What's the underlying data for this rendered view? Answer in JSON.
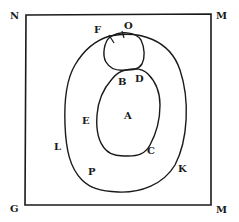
{
  "diagram": {
    "type": "set-region-diagram",
    "colors": {
      "stroke": "#1a1a1a",
      "background": "#ffffff"
    },
    "corner_labels": {
      "top_left": "N",
      "top_right": "M",
      "bottom_left": "G",
      "bottom_right": "M"
    },
    "region_labels": {
      "small_circle_top_left": "F",
      "small_circle_top": "O",
      "junction_left": "B",
      "junction_right": "D",
      "inner_oval_left": "E",
      "inner_oval_center": "A",
      "inner_oval_lower_right": "C",
      "outer_oval_left": "L",
      "outer_oval_lower_left": "P",
      "outer_oval_lower_right": "K"
    },
    "shapes": [
      {
        "name": "rectangle-frame",
        "corners": [
          "N",
          "M",
          "M",
          "G"
        ]
      },
      {
        "name": "outer-oval",
        "labels": [
          "L",
          "P",
          "K"
        ]
      },
      {
        "name": "small-circle",
        "labels": [
          "F",
          "O"
        ],
        "tick_marks": 2
      },
      {
        "name": "inner-oval",
        "labels": [
          "A",
          "B",
          "D",
          "E",
          "C"
        ]
      }
    ]
  }
}
